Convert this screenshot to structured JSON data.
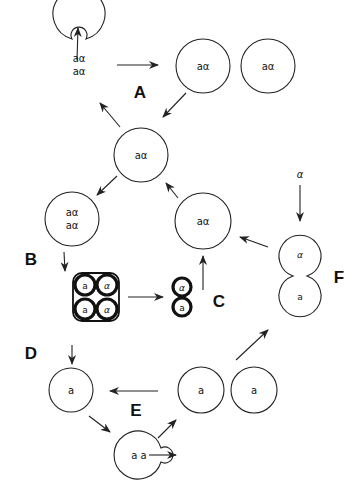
{
  "diagram": {
    "type": "yeast life cycle schematic",
    "labels": {
      "A": "A",
      "B": "B",
      "C": "C",
      "D": "D",
      "E": "E",
      "F": "F"
    },
    "cells": {
      "budding_diploid": {
        "line1": "aα",
        "line2": "aα"
      },
      "diploid_daughter_1": "aα",
      "diploid_daughter_2": "aα",
      "diploid_center": "aα",
      "diploid_premeiotic": {
        "line1": "aα",
        "line2": "aα"
      },
      "tetrad": [
        "a",
        "α",
        "a",
        "α"
      ],
      "spore_pair": [
        "α",
        "a"
      ],
      "zygote_from_spores": "aα",
      "haploid_a_left": "a",
      "budding_haploid": "a a",
      "haploid_a_daughter_1": "a",
      "haploid_a_daughter_2": "a",
      "mating_pair": [
        "α",
        "a"
      ],
      "incoming_alpha": "α"
    },
    "nodes": [
      {
        "id": "budding_diploid",
        "label": "aα / aα"
      },
      {
        "id": "diploid_daughters",
        "label": "aα aα"
      },
      {
        "id": "diploid_center",
        "label": "aα"
      },
      {
        "id": "diploid_premeiotic",
        "label": "aα / aα"
      },
      {
        "id": "tetrad",
        "label": "a α a α"
      },
      {
        "id": "spore_pair",
        "label": "α a"
      },
      {
        "id": "zygote_from_spores",
        "label": "aα"
      },
      {
        "id": "haploid_a",
        "label": "a"
      },
      {
        "id": "budding_haploid",
        "label": "a a"
      },
      {
        "id": "haploid_daughters",
        "label": "a a"
      },
      {
        "id": "mating_pair",
        "label": "α a"
      }
    ],
    "edges": [
      {
        "from": "budding_diploid",
        "to": "diploid_daughters"
      },
      {
        "from": "diploid_daughters",
        "to": "diploid_center"
      },
      {
        "from": "diploid_center",
        "to": "budding_diploid"
      },
      {
        "from": "diploid_center",
        "to": "diploid_premeiotic"
      },
      {
        "from": "diploid_premeiotic",
        "to": "tetrad"
      },
      {
        "from": "tetrad",
        "to": "spore_pair"
      },
      {
        "from": "spore_pair",
        "to": "zygote_from_spores"
      },
      {
        "from": "zygote_from_spores",
        "to": "diploid_center"
      },
      {
        "from": "tetrad",
        "to": "haploid_a"
      },
      {
        "from": "haploid_a",
        "to": "budding_haploid"
      },
      {
        "from": "budding_haploid",
        "to": "haploid_daughters"
      },
      {
        "from": "haploid_daughters",
        "to": "haploid_a"
      },
      {
        "from": "haploid_daughters",
        "to": "mating_pair"
      },
      {
        "from": "mating_pair",
        "to": "zygote_from_spores"
      }
    ]
  }
}
